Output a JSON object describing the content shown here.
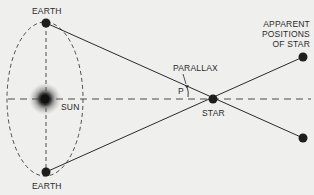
{
  "diagram": {
    "type": "stellar-parallax",
    "labels": {
      "earth_top": "EARTH",
      "earth_bottom": "EARTH",
      "sun": "SUN",
      "star": "STAR",
      "parallax": "PARALLAX",
      "angle": "P",
      "apparent_line1": "APPARENT",
      "apparent_line2": "POSITIONS",
      "apparent_line3": "OF STAR"
    },
    "colors": {
      "background": "#efefed",
      "ink": "#2a2a2a",
      "dot": "#1e1e1e"
    }
  }
}
